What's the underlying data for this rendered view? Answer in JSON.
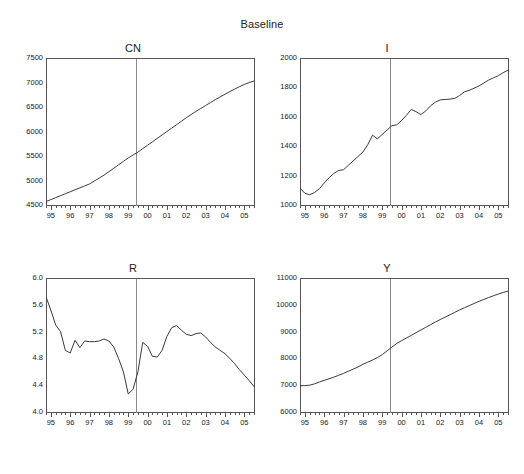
{
  "figure": {
    "main_title": "Baseline",
    "background": "#ffffff",
    "line_color": "#3a3a3a",
    "axis_color": "#555555",
    "marker_line_color": "#8a8a8a"
  },
  "chart_data": [
    {
      "type": "line",
      "title": "CN",
      "xlabel": "",
      "ylabel": "",
      "grid": false,
      "legend": "none",
      "xlim": [
        1994.75,
        2005.5
      ],
      "ylim": [
        4500,
        7500
      ],
      "ytick_labels": [
        "7500",
        "7000",
        "6500",
        "6000",
        "5500",
        "5000",
        "4500"
      ],
      "ytick_values": [
        7500,
        7000,
        6500,
        6000,
        5500,
        5000,
        4500
      ],
      "xtick_labels": [
        "95",
        "96",
        "97",
        "98",
        "99",
        "00",
        "01",
        "02",
        "03",
        "04",
        "05"
      ],
      "xtick_values": [
        1995,
        1996,
        1997,
        1998,
        1999,
        2000,
        2001,
        2002,
        2003,
        2004,
        2005
      ],
      "minor_ticks_per_interval": 4,
      "marker_line_x": 1999.4,
      "x": [
        1994.75,
        1995.0,
        1995.25,
        1995.5,
        1995.75,
        1996.0,
        1996.25,
        1996.5,
        1996.75,
        1997.0,
        1997.25,
        1997.5,
        1997.75,
        1998.0,
        1998.25,
        1998.5,
        1998.75,
        1999.0,
        1999.25,
        1999.5,
        1999.75,
        2000.0,
        2000.25,
        2000.5,
        2000.75,
        2001.0,
        2001.25,
        2001.5,
        2001.75,
        2002.0,
        2002.25,
        2002.5,
        2002.75,
        2003.0,
        2003.25,
        2003.5,
        2003.75,
        2004.0,
        2004.25,
        2004.5,
        2004.75,
        2005.0,
        2005.25,
        2005.5
      ],
      "y": [
        4570,
        4610,
        4650,
        4690,
        4730,
        4770,
        4810,
        4850,
        4890,
        4930,
        4990,
        5050,
        5110,
        5180,
        5250,
        5320,
        5390,
        5460,
        5520,
        5580,
        5650,
        5720,
        5790,
        5860,
        5930,
        6000,
        6070,
        6140,
        6210,
        6280,
        6345,
        6410,
        6470,
        6530,
        6590,
        6650,
        6705,
        6760,
        6815,
        6865,
        6915,
        6960,
        7000,
        7030
      ]
    },
    {
      "type": "line",
      "title": "I",
      "xlabel": "",
      "ylabel": "",
      "grid": false,
      "legend": "none",
      "xlim": [
        1994.75,
        2005.5
      ],
      "ylim": [
        1000,
        2000
      ],
      "ytick_labels": [
        "2000",
        "1800",
        "1600",
        "1400",
        "1200",
        "1000"
      ],
      "ytick_values": [
        2000,
        1800,
        1600,
        1400,
        1200,
        1000
      ],
      "xtick_labels": [
        "95",
        "96",
        "97",
        "98",
        "99",
        "00",
        "01",
        "02",
        "03",
        "04",
        "05"
      ],
      "xtick_values": [
        1995,
        1996,
        1997,
        1998,
        1999,
        2000,
        2001,
        2002,
        2003,
        2004,
        2005
      ],
      "minor_ticks_per_interval": 4,
      "marker_line_x": 1999.4,
      "x": [
        1994.75,
        1995.0,
        1995.25,
        1995.5,
        1995.75,
        1996.0,
        1996.25,
        1996.5,
        1996.75,
        1997.0,
        1997.25,
        1997.5,
        1997.75,
        1998.0,
        1998.25,
        1998.5,
        1998.75,
        1999.0,
        1999.25,
        1999.5,
        1999.75,
        2000.0,
        2000.25,
        2000.5,
        2000.75,
        2001.0,
        2001.25,
        2001.5,
        2001.75,
        2002.0,
        2002.25,
        2002.5,
        2002.75,
        2003.0,
        2003.25,
        2003.5,
        2003.75,
        2004.0,
        2004.25,
        2004.5,
        2004.75,
        2005.0,
        2005.25,
        2005.5
      ],
      "y": [
        1115,
        1080,
        1070,
        1085,
        1110,
        1150,
        1185,
        1215,
        1235,
        1240,
        1270,
        1300,
        1330,
        1360,
        1410,
        1475,
        1450,
        1480,
        1510,
        1540,
        1545,
        1575,
        1610,
        1650,
        1635,
        1615,
        1640,
        1675,
        1700,
        1715,
        1718,
        1720,
        1725,
        1745,
        1770,
        1780,
        1795,
        1810,
        1830,
        1850,
        1865,
        1880,
        1900,
        1918
      ]
    },
    {
      "type": "line",
      "title": "R",
      "xlabel": "",
      "ylabel": "",
      "grid": false,
      "legend": "none",
      "xlim": [
        1994.75,
        2005.5
      ],
      "ylim": [
        4.0,
        6.0
      ],
      "ytick_labels": [
        "6.0",
        "5.6",
        "5.2",
        "4.8",
        "4.4",
        "4.0"
      ],
      "ytick_values": [
        6.0,
        5.6,
        5.2,
        4.8,
        4.4,
        4.0
      ],
      "xtick_labels": [
        "95",
        "96",
        "97",
        "98",
        "99",
        "00",
        "01",
        "02",
        "03",
        "04",
        "05"
      ],
      "xtick_values": [
        1995,
        1996,
        1997,
        1998,
        1999,
        2000,
        2001,
        2002,
        2003,
        2004,
        2005
      ],
      "minor_ticks_per_interval": 4,
      "marker_line_x": 1999.4,
      "x": [
        1994.75,
        1995.0,
        1995.25,
        1995.5,
        1995.75,
        1996.0,
        1996.25,
        1996.5,
        1996.75,
        1997.0,
        1997.25,
        1997.5,
        1997.75,
        1998.0,
        1998.25,
        1998.5,
        1998.75,
        1999.0,
        1999.25,
        1999.5,
        1999.75,
        2000.0,
        2000.25,
        2000.5,
        2000.75,
        2001.0,
        2001.25,
        2001.5,
        2001.75,
        2002.0,
        2002.25,
        2002.5,
        2002.75,
        2003.0,
        2003.25,
        2003.5,
        2003.75,
        2004.0,
        2004.25,
        2004.5,
        2004.75,
        2005.0,
        2005.25,
        2005.5
      ],
      "y": [
        5.72,
        5.52,
        5.3,
        5.2,
        4.92,
        4.88,
        5.07,
        4.96,
        5.06,
        5.05,
        5.05,
        5.06,
        5.09,
        5.06,
        4.97,
        4.8,
        4.6,
        4.27,
        4.34,
        4.6,
        5.04,
        4.98,
        4.83,
        4.82,
        4.92,
        5.13,
        5.26,
        5.29,
        5.22,
        5.16,
        5.14,
        5.17,
        5.18,
        5.12,
        5.04,
        4.97,
        4.92,
        4.87,
        4.8,
        4.72,
        4.63,
        4.55,
        4.47,
        4.38
      ]
    },
    {
      "type": "line",
      "title": "Y",
      "xlabel": "",
      "ylabel": "",
      "grid": false,
      "legend": "none",
      "xlim": [
        1994.75,
        2005.5
      ],
      "ylim": [
        6000,
        11000
      ],
      "ytick_labels": [
        "11000",
        "10000",
        "9000",
        "8000",
        "7000",
        "6000"
      ],
      "ytick_values": [
        11000,
        10000,
        9000,
        8000,
        7000,
        6000
      ],
      "xtick_labels": [
        "95",
        "96",
        "97",
        "98",
        "99",
        "00",
        "01",
        "02",
        "03",
        "04",
        "05"
      ],
      "xtick_values": [
        1995,
        1996,
        1997,
        1998,
        1999,
        2000,
        2001,
        2002,
        2003,
        2004,
        2005
      ],
      "minor_ticks_per_interval": 4,
      "marker_line_x": 1999.4,
      "x": [
        1994.75,
        1995.0,
        1995.25,
        1995.5,
        1995.75,
        1996.0,
        1996.25,
        1996.5,
        1996.75,
        1997.0,
        1997.25,
        1997.5,
        1997.75,
        1998.0,
        1998.25,
        1998.5,
        1998.75,
        1999.0,
        1999.25,
        1999.5,
        1999.75,
        2000.0,
        2000.25,
        2000.5,
        2000.75,
        2001.0,
        2001.25,
        2001.5,
        2001.75,
        2002.0,
        2002.25,
        2002.5,
        2002.75,
        2003.0,
        2003.25,
        2003.5,
        2003.75,
        2004.0,
        2004.25,
        2004.5,
        2004.75,
        2005.0,
        2005.25,
        2005.5
      ],
      "y": [
        6980,
        6985,
        7000,
        7050,
        7120,
        7180,
        7240,
        7300,
        7370,
        7440,
        7520,
        7600,
        7680,
        7780,
        7860,
        7940,
        8030,
        8140,
        8280,
        8420,
        8560,
        8660,
        8760,
        8860,
        8960,
        9060,
        9160,
        9260,
        9360,
        9450,
        9540,
        9630,
        9720,
        9810,
        9890,
        9970,
        10050,
        10130,
        10200,
        10270,
        10340,
        10400,
        10460,
        10510
      ]
    }
  ]
}
